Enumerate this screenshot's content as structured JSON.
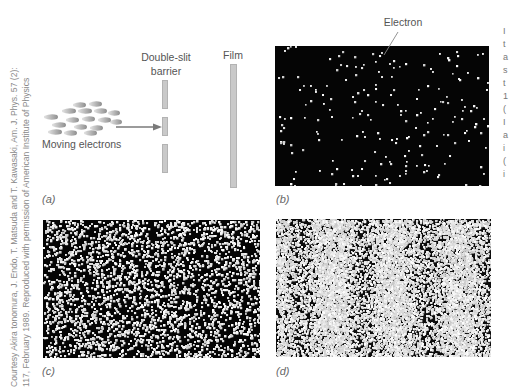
{
  "credit": {
    "line1": "Courtesy Akira tonomura, J. Endo, T. Matsuda and T. Kawasaki, Am. J. Phys. 57 (2):",
    "line2": "117, February 1989. Reproduced with permission of American Institute of Physics"
  },
  "panel_a": {
    "label": "(a)",
    "electrons_label": "Moving electrons",
    "barrier_label_line1": "Double-slit",
    "barrier_label_line2": "barrier",
    "film_label": "Film",
    "colors": {
      "electron": "#8e8e8e",
      "barrier": "#c9c9c9",
      "arrow": "#777777"
    }
  },
  "panel_b": {
    "label": "(b)",
    "annotation": "Electron",
    "dot_count": 200,
    "seed": 11
  },
  "panel_c": {
    "label": "(c)",
    "dot_count": 3000,
    "seed": 23
  },
  "panel_d": {
    "label": "(d)",
    "dot_count": 14000,
    "seed": 37,
    "bright_band_centers_px": [
      55,
      117,
      182
    ],
    "band_period_px": 64
  },
  "right_edge_fragments": [
    "I",
    "t",
    "a",
    "s",
    "t",
    "1",
    "(",
    "I",
    "a",
    "i",
    "(",
    "i"
  ]
}
